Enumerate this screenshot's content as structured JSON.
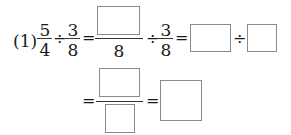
{
  "problem": {
    "label": "(1)",
    "first_fraction": {
      "numerator": "5",
      "denominator": "4"
    },
    "divide_sign": "÷",
    "second_fraction": {
      "numerator": "3",
      "denominator": "8"
    },
    "equals": "=",
    "step1": {
      "numerator_box": "",
      "denominator": "8",
      "divide_sign": "÷",
      "fraction": {
        "numerator": "3",
        "denominator": "8"
      }
    },
    "step2": {
      "box_a": "",
      "divide_sign": "÷",
      "box_b": ""
    },
    "step3": {
      "numerator_box": "",
      "denominator_box": ""
    },
    "answer_box": ""
  }
}
